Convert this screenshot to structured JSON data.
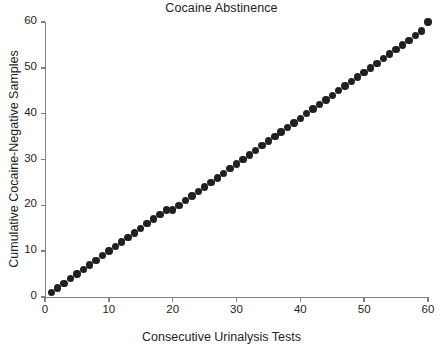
{
  "chart_data": {
    "type": "scatter",
    "title": "Cocaine Abstinence",
    "xlabel": "Consecutive Urinalysis Tests",
    "ylabel": "Cumulative Cocaine-Negative Samples",
    "xlim": [
      0,
      60
    ],
    "ylim": [
      0,
      60
    ],
    "xticks": [
      0,
      10,
      20,
      30,
      40,
      50,
      60
    ],
    "yticks": [
      0,
      10,
      20,
      30,
      40,
      50,
      60
    ],
    "grid": false,
    "legend": null,
    "marker": "filled-circle",
    "marker_color": "#231f20",
    "axis_color": "#7f8083",
    "x": [
      1,
      2,
      3,
      4,
      5,
      6,
      7,
      8,
      9,
      10,
      11,
      12,
      13,
      14,
      15,
      16,
      17,
      18,
      19,
      20,
      21,
      22,
      23,
      24,
      25,
      26,
      27,
      28,
      29,
      30,
      31,
      32,
      33,
      34,
      35,
      36,
      37,
      38,
      39,
      40,
      41,
      42,
      43,
      44,
      45,
      46,
      47,
      48,
      49,
      50,
      51,
      52,
      53,
      54,
      55,
      56,
      57,
      58,
      59,
      60
    ],
    "y": [
      1,
      2,
      3,
      4,
      5,
      6,
      7,
      8,
      9,
      10,
      11,
      12,
      13,
      14,
      15,
      16,
      17,
      18,
      19,
      19,
      20,
      21,
      22,
      23,
      24,
      25,
      26,
      27,
      28,
      29,
      30,
      31,
      32,
      33,
      34,
      35,
      36,
      37,
      38,
      39,
      40,
      41,
      42,
      43,
      44,
      45,
      46,
      47,
      48,
      49,
      50,
      51,
      52,
      53,
      54,
      55,
      56,
      57,
      58,
      60
    ]
  }
}
